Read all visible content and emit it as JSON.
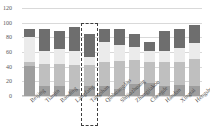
{
  "chart_data": {
    "type": "bar",
    "stacked": true,
    "title": "",
    "subtitle": "",
    "xlabel": "",
    "ylabel": "",
    "ylim": [
      0,
      120
    ],
    "yticks": [
      0,
      20,
      40,
      60,
      80,
      100,
      120
    ],
    "ytick_labels": [
      "0",
      "20",
      "40",
      "60",
      "80",
      "100",
      "120"
    ],
    "grid": true,
    "legend": false,
    "legend_position": "none",
    "categories": [
      "Beijing",
      "Tianjin",
      "Baoding",
      "Langfang",
      "Tangshan",
      "Qinhuangdao",
      "Shijiazhuang",
      "Zhangjiakou",
      "Chengde",
      "Handan",
      "Xingtai",
      "Hengshui"
    ],
    "series": [
      {
        "name": "Segment 1",
        "color": "#9e9e9e",
        "values": [
          41,
          13,
          13,
          9,
          13,
          14,
          10,
          17,
          18,
          14,
          15,
          14
        ]
      },
      {
        "name": "Segment 2",
        "color": "#bfbfbf",
        "values": [
          6,
          31,
          30,
          33,
          29,
          33,
          38,
          32,
          28,
          33,
          31,
          37
        ]
      },
      {
        "name": "Segment 3",
        "color": "#ebebeb",
        "values": [
          33,
          18,
          21,
          20,
          11,
          26,
          21,
          18,
          16,
          15,
          20,
          21
        ]
      },
      {
        "name": "Segment 4",
        "color": "#6e6e6e",
        "values": [
          11,
          30,
          24,
          32,
          32,
          19,
          23,
          17,
          12,
          27,
          26,
          25
        ]
      }
    ],
    "totals": [
      91,
      92,
      88,
      94,
      85,
      92,
      92,
      84,
      74,
      89,
      92,
      97
    ],
    "annotations": [
      {
        "type": "highlight-box",
        "style": "dashed",
        "target_category": "Tangshan",
        "color": "#3f3f3f",
        "y_top": 100,
        "y_bottom": 0
      }
    ]
  }
}
